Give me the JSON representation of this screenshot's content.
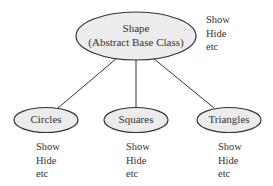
{
  "diagram": {
    "root": {
      "title": "Shape",
      "subtitle": "(Abstract Base Class)",
      "methods": [
        "Show",
        "Hide",
        "etc"
      ]
    },
    "children": [
      {
        "title": "Circles",
        "methods": [
          "Show",
          "Hide",
          "etc"
        ]
      },
      {
        "title": "Squares",
        "methods": [
          "Show",
          "Hide",
          "etc"
        ]
      },
      {
        "title": "Triangles",
        "methods": [
          "Show",
          "Hide",
          "etc"
        ]
      }
    ],
    "colors": {
      "node_fill": "#ececec",
      "stroke": "#333333"
    }
  }
}
